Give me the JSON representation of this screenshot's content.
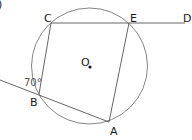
{
  "figure": {
    "partial_label": ")",
    "points": {
      "A": {
        "label": "A",
        "x": 109,
        "y": 122
      },
      "B": {
        "label": "B",
        "x": 39,
        "y": 94
      },
      "C": {
        "label": "C",
        "x": 51,
        "y": 23
      },
      "D": {
        "label": "D",
        "x": 185,
        "y": 23
      },
      "E": {
        "label": "E",
        "x": 129,
        "y": 23
      },
      "O": {
        "label": "O",
        "x": 90,
        "y": 67
      }
    },
    "circle": {
      "cx": 89.5,
      "cy": 66,
      "r": 58
    },
    "angle_label": "70°",
    "colors": {
      "line": "#555555",
      "circle": "#777777",
      "text": "#1a1a1a"
    }
  }
}
